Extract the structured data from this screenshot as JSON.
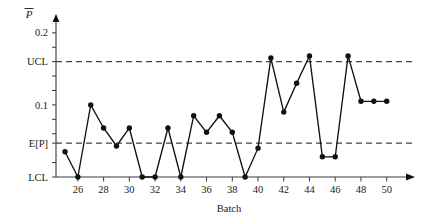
{
  "chart_data": {
    "type": "line",
    "title": "",
    "xlabel": "Batch",
    "ylabel": "P̄",
    "ylabel_plain": "p-bar",
    "x": [
      25,
      26,
      27,
      28,
      29,
      30,
      31,
      32,
      33,
      34,
      35,
      36,
      37,
      38,
      39,
      40,
      41,
      42,
      43,
      44,
      45,
      46,
      47,
      48,
      49,
      50
    ],
    "values": [
      0.035,
      0.0,
      0.1,
      0.068,
      0.043,
      0.068,
      0.0,
      0.0,
      0.068,
      0.0,
      0.085,
      0.062,
      0.085,
      0.062,
      0.0,
      0.04,
      0.165,
      0.09,
      0.13,
      0.168,
      0.028,
      0.028,
      0.168,
      0.105,
      0.105,
      0.105
    ],
    "categories": [
      "25",
      "26",
      "27",
      "28",
      "29",
      "30",
      "31",
      "32",
      "33",
      "34",
      "35",
      "36",
      "37",
      "38",
      "39",
      "40",
      "41",
      "42",
      "43",
      "44",
      "45",
      "46",
      "47",
      "48",
      "49",
      "50"
    ],
    "series": [
      {
        "name": "p-bar",
        "values": [
          0.035,
          0.0,
          0.1,
          0.068,
          0.043,
          0.068,
          0.0,
          0.0,
          0.068,
          0.0,
          0.085,
          0.062,
          0.085,
          0.062,
          0.0,
          0.04,
          0.165,
          0.09,
          0.13,
          0.168,
          0.028,
          0.028,
          0.168,
          0.105,
          0.105,
          0.105
        ],
        "marker": "filled-circle",
        "color": "#111111"
      }
    ],
    "xlim": [
      24.3,
      51.5
    ],
    "ylim": [
      0.0,
      0.215
    ],
    "xticks": [
      26,
      28,
      30,
      32,
      34,
      36,
      38,
      40,
      42,
      44,
      46,
      48,
      50
    ],
    "xticklabels": [
      "26",
      "28",
      "30",
      "32",
      "34",
      "36",
      "38",
      "40",
      "42",
      "44",
      "46",
      "48",
      "50"
    ],
    "yticks": [
      0.0,
      0.02,
      0.047,
      0.06,
      0.08,
      0.1,
      0.12,
      0.14,
      0.16,
      0.18,
      0.2
    ],
    "ytick_labeled": [
      {
        "value": 0.2,
        "label": "0.2"
      },
      {
        "value": 0.16,
        "label": "UCL"
      },
      {
        "value": 0.1,
        "label": "0.1"
      },
      {
        "value": 0.047,
        "label": "E[P]"
      },
      {
        "value": 0.0,
        "label": "LCL"
      }
    ],
    "reference_lines": [
      {
        "name": "UCL",
        "label": "UCL",
        "value": 0.16,
        "style": "dashed",
        "color": "#444444"
      },
      {
        "name": "E[P]",
        "label": "E[P]",
        "value": 0.047,
        "style": "dashed",
        "color": "#444444"
      },
      {
        "name": "LCL",
        "label": "LCL",
        "value": 0.0,
        "style": "solid-axis",
        "color": "#3a3a3a"
      }
    ],
    "grid": false,
    "legend": null,
    "legend_position": "none",
    "annotations": []
  },
  "axis": {
    "y_title": "P̄",
    "x_title": "Batch",
    "ytick_labels": [
      "0.2",
      "UCL",
      "0.1",
      "E[P]",
      "LCL"
    ],
    "xtick_labels": [
      "26",
      "28",
      "30",
      "32",
      "34",
      "36",
      "38",
      "40",
      "42",
      "44",
      "46",
      "48",
      "50"
    ]
  },
  "colors": {
    "series": "#111111",
    "axis": "#3a3a3a",
    "limit_line": "#444444",
    "background": "#ffffff",
    "text": "#1a1a1a"
  }
}
